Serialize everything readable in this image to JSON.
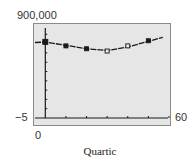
{
  "window": {
    "xmin_label": "−5",
    "xmax_label": "60",
    "ymin_label": "0",
    "ymax_label": "900,000"
  },
  "caption": "Quartic",
  "colors": {
    "screen_bg": "#e6e6e6",
    "frame": "#888888",
    "ink": "#1a1a1a"
  },
  "chart_data": {
    "type": "scatter",
    "title": "Quartic",
    "xlabel": "",
    "ylabel": "",
    "xlim": [
      -5,
      60
    ],
    "ylim": [
      0,
      900000
    ],
    "grid": false,
    "x_tick_step": 10,
    "series": [
      {
        "name": "data points",
        "x": [
          0,
          10,
          20,
          30,
          40,
          50
        ],
        "y": [
          735000,
          700000,
          675000,
          655000,
          700000,
          745000
        ]
      },
      {
        "name": "quartic regression curve",
        "x": [
          -5,
          0,
          10,
          20,
          30,
          40,
          50,
          57
        ],
        "y": [
          730000,
          733000,
          705000,
          675000,
          660000,
          690000,
          740000,
          775000
        ]
      }
    ]
  }
}
